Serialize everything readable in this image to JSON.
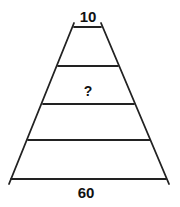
{
  "diagram": {
    "type": "trapezoid-ladder",
    "top_width_label": "10",
    "bottom_width_label": "60",
    "unknown_label": "?",
    "rungs": 5,
    "line_color": "#222222"
  }
}
